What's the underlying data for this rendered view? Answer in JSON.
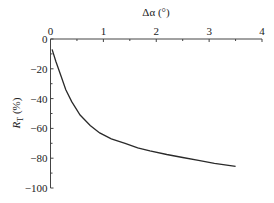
{
  "chart_data": {
    "type": "line",
    "title": "",
    "xlabel": "Δα (°)",
    "ylabel": "R_T (%)",
    "xlim": [
      0,
      4
    ],
    "ylim": [
      -100,
      0
    ],
    "x_axis_position": "top",
    "grid": false,
    "legend": null,
    "x_ticks": [
      "0",
      "1",
      "2",
      "3",
      "4"
    ],
    "y_ticks": [
      "0",
      "-20",
      "-40",
      "-60",
      "-80",
      "-100"
    ],
    "series": [
      {
        "name": "R_T",
        "x": [
          0.03,
          0.1,
          0.2,
          0.29,
          0.4,
          0.56,
          0.75,
          0.93,
          1.15,
          1.41,
          1.65,
          1.88,
          2.2,
          2.5,
          2.8,
          3.1,
          3.5
        ],
        "y": [
          -7,
          -15,
          -25,
          -34,
          -42,
          -51,
          -58,
          -63,
          -67,
          -70,
          -73,
          -75,
          -77.5,
          -79.5,
          -81.5,
          -83.5,
          -85.5
        ]
      }
    ]
  }
}
